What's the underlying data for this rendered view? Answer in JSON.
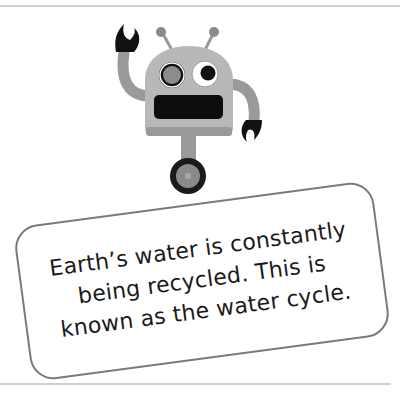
{
  "illustration": {
    "subject": "robot-mascot",
    "colors": {
      "body": "#b8b8b8",
      "body_dark": "#8f8f8f",
      "claw": "#111111",
      "mouth": "#0d0d0d",
      "wheel_rim": "#1a1a1a",
      "wheel_hub": "#8a8a8a"
    }
  },
  "card": {
    "lines": [
      "Earth’s water is constantly",
      "being recycled. This is",
      "known as the water cycle."
    ],
    "border_color": "#7a7a7a"
  },
  "rules": {
    "color": "#cfcfcf"
  }
}
